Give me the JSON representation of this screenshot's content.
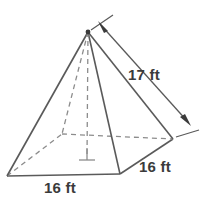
{
  "figure": {
    "type": "square-pyramid-diagram",
    "stroke_color": "#5a5a5a",
    "dash_color": "#8c8c8c",
    "text_color": "#3b3b3b",
    "background": "#ffffff"
  },
  "labels": {
    "slant_height": "17 ft",
    "base_edge_right": "16 ft",
    "base_edge_front": "16 ft"
  },
  "geometry": {
    "apex": [
      88,
      32
    ],
    "base_left": [
      7,
      176
    ],
    "base_front": [
      120,
      174
    ],
    "base_right": [
      173,
      139
    ],
    "base_back": [
      62,
      134
    ],
    "height_foot": [
      87,
      156
    ],
    "dimension_line_start": [
      100,
      22
    ],
    "dimension_line_end": [
      190,
      123
    ]
  }
}
